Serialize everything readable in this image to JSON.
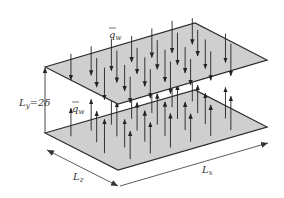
{
  "diagram": {
    "labels": {
      "top_flux": "q",
      "top_flux_sub": "w",
      "bottom_flux": "q",
      "bottom_flux_sub": "w",
      "height": "L",
      "height_sub": "y",
      "height_value": "=2δ",
      "spanwise": "L",
      "spanwise_sub": "z",
      "streamwise": "L",
      "streamwise_sub": "x"
    },
    "colors": {
      "plate_fill": "#cfcfcf",
      "plate_edge": "#2a2a2a",
      "arrow": "#222222",
      "text": "#333333"
    },
    "top_plate": {
      "corners": [
        [
          45,
          67
        ],
        [
          195,
          23
        ],
        [
          267,
          60
        ],
        [
          118,
          104
        ]
      ],
      "arrow_direction": "down"
    },
    "bottom_plate": {
      "corners": [
        [
          45,
          133
        ],
        [
          195,
          90
        ],
        [
          267,
          127
        ],
        [
          118,
          170
        ]
      ],
      "arrow_direction": "up"
    }
  }
}
